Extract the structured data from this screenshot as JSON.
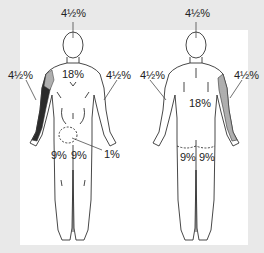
{
  "colors": {
    "background": "#e9e9e9",
    "panel": "#ffffff",
    "outline": "#333333",
    "burn_dark": "#2b2b2b",
    "burn_hatched": "#9a9a9a"
  },
  "front": {
    "view": "anterior",
    "labels": {
      "head": "4½%",
      "trunk": "18%",
      "right_arm": "4½%",
      "left_arm": "4½%",
      "right_leg": "9%",
      "left_leg": "9%",
      "genitals": "1%"
    }
  },
  "back": {
    "view": "posterior",
    "labels": {
      "head": "4½%",
      "trunk": "18%",
      "left_arm": "4½%",
      "right_arm": "4½%",
      "left_leg": "9%",
      "right_leg": "9%"
    }
  }
}
